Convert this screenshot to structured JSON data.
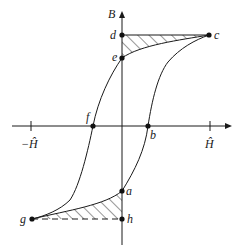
{
  "diagram": {
    "title": "",
    "axes": {
      "vertical_label": "B",
      "horizontal_ticks": [
        {
          "label": "−Ĥ",
          "position": "negative"
        },
        {
          "label": "Ĥ",
          "position": "positive"
        }
      ]
    },
    "points": {
      "a": "a",
      "b": "b",
      "c": "c",
      "d": "d",
      "e": "e",
      "f": "f",
      "g": "g",
      "h": "h"
    },
    "colors": {
      "line": "#1a1a1a",
      "background": "#ffffff"
    }
  }
}
